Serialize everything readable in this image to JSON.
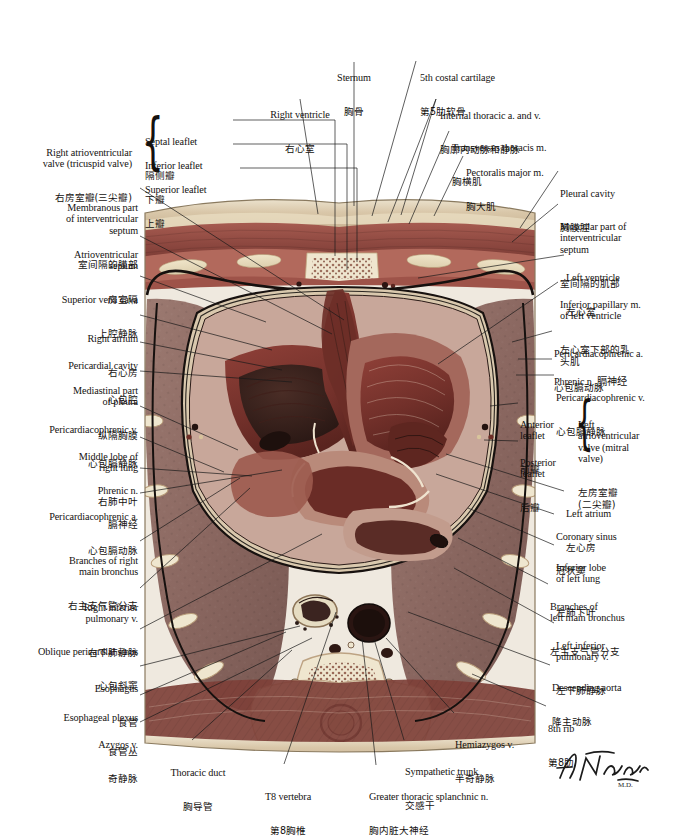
{
  "plate": {
    "title": "Cross Section of Thorax at T8 Vertebral Level",
    "artist_signature": "F. Netter",
    "figure_caption": ""
  },
  "colors": {
    "ink": "#14110f",
    "leader": "#1a1a1a",
    "muscle": "#9c4d46",
    "lung": "#8e6f68",
    "fat": "#e3d8bd",
    "bone": "#efe6cf",
    "cavity": "#3b2520",
    "myocardium": "#7e3a33",
    "vessel_dark": "#2b1714",
    "pleura": "#141110",
    "skin": "#d9c9ad"
  },
  "labels_top": [
    {
      "id": "sternum",
      "en": "Sternum",
      "cn": "胸骨",
      "align": "c",
      "x": 311,
      "y": 49,
      "w": 86
    },
    {
      "id": "right-ventricle",
      "en": "Right ventricle",
      "cn": "右心室",
      "align": "c",
      "x": 252,
      "y": 86,
      "w": 96
    },
    {
      "id": "5th-costal-cartilage",
      "en": "5th costal cartilage",
      "cn": "第5肋软骨",
      "align": "l",
      "x": 420,
      "y": 49,
      "w": 120
    },
    {
      "id": "internal-thoracic",
      "en": "Internal thoracic a. and v.",
      "cn": "胸廓内动脉和静脉",
      "align": "l",
      "x": 440,
      "y": 87,
      "w": 140
    },
    {
      "id": "transversus-thoracis",
      "en": "Transversus thoracis m.",
      "cn": "胸横肌",
      "align": "l",
      "x": 452,
      "y": 119,
      "w": 128
    },
    {
      "id": "pectoralis-major",
      "en": "Pectoralis major m.",
      "cn": "胸大肌",
      "align": "l",
      "x": 466,
      "y": 144,
      "w": 120
    }
  ],
  "labels_left": [
    {
      "id": "septal-leaflet",
      "en": "Septal leaflet",
      "cn": "隔侧瓣",
      "align": "l",
      "x": 145,
      "y": 116,
      "w": 80
    },
    {
      "id": "inferior-leaflet",
      "en": "Inferior leaflet",
      "cn": "下瓣",
      "align": "l",
      "x": 145,
      "y": 140,
      "w": 80
    },
    {
      "id": "superior-leaflet",
      "en": "Superior leaflet",
      "cn": "上瓣",
      "align": "l",
      "x": 145,
      "y": 164,
      "w": 86
    },
    {
      "id": "right-av-valve",
      "en": "Right atrioventricular\nvalve (tricuspid valve)",
      "cn": "右房室瓣(三尖瓣)",
      "align": "r",
      "x": 16,
      "y": 125,
      "w": 122
    },
    {
      "id": "membranous-ivs",
      "en": "Membranous part\nof interventricular\nseptum",
      "cn": "室间隔的膜部",
      "align": "r",
      "x": 22,
      "y": 180,
      "w": 116
    },
    {
      "id": "av-septum",
      "en": "Atrioventricular\nseptum",
      "cn": "房室隔",
      "align": "r",
      "x": 22,
      "y": 230,
      "w": 116
    },
    {
      "id": "superior-vena-cava",
      "en": "Superior vena cava",
      "cn": "上腔静脉",
      "align": "r",
      "x": 16,
      "y": 273,
      "w": 122
    },
    {
      "id": "right-atrium",
      "en": "Right atrium",
      "cn": "右心房",
      "align": "r",
      "x": 30,
      "y": 311,
      "w": 108
    },
    {
      "id": "pericardial-cavity",
      "en": "Pericardial cavity",
      "cn": "心包腔",
      "align": "r",
      "x": 22,
      "y": 338,
      "w": 116
    },
    {
      "id": "mediastinal-pleura",
      "en": "Mediastinal part\nof pleura",
      "cn": "纵隔胸膜",
      "align": "r",
      "x": 22,
      "y": 364,
      "w": 116
    },
    {
      "id": "pericardiacophrenic-v-left",
      "en": "Pericardiacophrenic v.",
      "cn": "心包膈静脉",
      "align": "r",
      "x": 8,
      "y": 402,
      "w": 130
    },
    {
      "id": "middle-lobe-right-lung",
      "en": "Middle lobe of\nright lung",
      "cn": "右肺中叶",
      "align": "r",
      "x": 30,
      "y": 430,
      "w": 108
    },
    {
      "id": "phrenic-n-left",
      "en": "Phrenic n.",
      "cn": "膈神经",
      "align": "r",
      "x": 40,
      "y": 464,
      "w": 98
    },
    {
      "id": "pericardiacophrenic-a-left",
      "en": "Pericardiacophrenic a.",
      "cn": "心包膈动脉",
      "align": "r",
      "x": 8,
      "y": 489,
      "w": 130
    },
    {
      "id": "branches-right-bronchus",
      "en": "Branches of right\nmain bronchus",
      "cn": "右主支气管分支",
      "align": "r",
      "x": 26,
      "y": 534,
      "w": 112
    },
    {
      "id": "right-inferior-pulmonary-v",
      "en": "Right inferior\npulmonary v.",
      "cn": "右下肺静脉",
      "align": "r",
      "x": 34,
      "y": 581,
      "w": 104
    },
    {
      "id": "oblique-pericardial-sinus",
      "en": "Oblique pericardial sinus",
      "cn": "心包斜窦",
      "align": "r",
      "x": 8,
      "y": 625,
      "w": 130
    },
    {
      "id": "esophagus",
      "en": "Esophagus",
      "cn": "食管",
      "align": "r",
      "x": 40,
      "y": 662,
      "w": 98
    },
    {
      "id": "esophageal-plexus",
      "en": "Esophageal plexus",
      "cn": "食管丛",
      "align": "r",
      "x": 22,
      "y": 691,
      "w": 116
    },
    {
      "id": "azygos-v",
      "en": "Azygos v.",
      "cn": "奇静脉",
      "align": "r",
      "x": 54,
      "y": 718,
      "w": 84
    }
  ],
  "labels_bottom": [
    {
      "id": "thoracic-duct",
      "en": "Thoracic duct",
      "cn": "胸导管",
      "align": "c",
      "x": 148,
      "y": 746,
      "w": 96
    },
    {
      "id": "t8-vertebra",
      "en": "T8 vertebra",
      "cn": "第8胸椎",
      "align": "c",
      "x": 238,
      "y": 770,
      "w": 96
    },
    {
      "id": "greater-splanchnic-n",
      "en": "Greater thoracic splanchnic n.",
      "cn": "胸内脏大神经",
      "align": "l",
      "x": 369,
      "y": 770,
      "w": 160
    },
    {
      "id": "sympathetic-trunk",
      "en": "Sympathetic trunk",
      "cn": "交感干",
      "align": "l",
      "x": 405,
      "y": 745,
      "w": 120
    },
    {
      "id": "hemiazygos-v",
      "en": "Hemiazygos v.",
      "cn": "半奇静脉",
      "align": "l",
      "x": 455,
      "y": 718,
      "w": 110
    }
  ],
  "labels_right": [
    {
      "id": "pleural-cavity",
      "en": "Pleural cavity",
      "cn": "胸膜腔",
      "align": "l",
      "x": 560,
      "y": 167,
      "w": 110
    },
    {
      "id": "muscular-ivs",
      "en": "Muscular part of\ninterventricular\nseptum",
      "cn": "室间隔的肌部",
      "align": "l",
      "x": 560,
      "y": 200,
      "w": 112
    },
    {
      "id": "left-ventricle",
      "en": "Left ventricle",
      "cn": "左心室",
      "align": "l",
      "x": 566,
      "y": 251,
      "w": 106
    },
    {
      "id": "inferior-papillary-m",
      "en": "Inferior papillary m.\nof left ventricle",
      "cn": "左心室下部的乳\n头肌",
      "align": "l",
      "x": 560,
      "y": 278,
      "w": 114
    },
    {
      "id": "pericardiacophrenic-a-right",
      "en": "Pericardiacophrenic a.",
      "cn": "心包膈动脉",
      "align": "l",
      "x": 554,
      "y": 327,
      "w": 120
    },
    {
      "id": "phrenic-n-right",
      "en": "Phrenic n. 膈神经",
      "cn": "",
      "align": "l",
      "x": 554,
      "y": 355,
      "w": 120
    },
    {
      "id": "pericardiacophrenic-v-right",
      "en": "Pericardiacophrenic v.",
      "cn": "心包膈静脉",
      "align": "l",
      "x": 556,
      "y": 371,
      "w": 118
    },
    {
      "id": "anterior-leaflet",
      "en": "Anterior\nleaflet",
      "cn": "前瓣",
      "align": "l",
      "x": 520,
      "y": 399,
      "w": 44
    },
    {
      "id": "posterior-leaflet",
      "en": "Posterior\nleaflet",
      "cn": "后瓣",
      "align": "l",
      "x": 520,
      "y": 437,
      "w": 46
    },
    {
      "id": "left-av-valve",
      "en": "Left\natrioventricular\nvalve (mitral\nvalve)",
      "cn": "左房室瓣\n(二尖瓣)",
      "align": "l",
      "x": 578,
      "y": 399,
      "w": 96
    },
    {
      "id": "left-atrium",
      "en": "Left atrium",
      "cn": "左心房",
      "align": "l",
      "x": 566,
      "y": 487,
      "w": 106
    },
    {
      "id": "coronary-sinus",
      "en": "Coronary sinus",
      "cn": "冠状窦",
      "align": "l",
      "x": 556,
      "y": 510,
      "w": 116
    },
    {
      "id": "inferior-lobe-left-lung",
      "en": "Inferior lobe\nof left lung",
      "cn": "左肺下叶",
      "align": "l",
      "x": 556,
      "y": 541,
      "w": 116
    },
    {
      "id": "branches-left-bronchus",
      "en": "Branches of\nleft main bronchus",
      "cn": "左主支气管分支",
      "align": "l",
      "x": 550,
      "y": 580,
      "w": 124
    },
    {
      "id": "left-inferior-pulmonary-v",
      "en": "Left inferior\npulmonary v.",
      "cn": "左下肺静脉",
      "align": "l",
      "x": 556,
      "y": 619,
      "w": 118
    },
    {
      "id": "descending-aorta",
      "en": "Descending aorta",
      "cn": "降主动脉",
      "align": "l",
      "x": 552,
      "y": 661,
      "w": 122
    },
    {
      "id": "8th-rib",
      "en": "8th rib",
      "cn": "第8肋",
      "align": "l",
      "x": 548,
      "y": 702,
      "w": 80
    }
  ],
  "leaders": [
    {
      "id": "ld-sternum",
      "d": "M 354 62 L 354 206"
    },
    {
      "id": "ld-right-ventricle",
      "d": "M 300 99 L 316 213"
    },
    {
      "id": "ld-5th-costal",
      "d": "M 418 61 L 370 215"
    },
    {
      "id": "ld-internal-thoracic-1",
      "d": "M 438 99 L 386 221"
    },
    {
      "id": "ld-internal-thoracic-2",
      "d": "M 438 99 L 399 214"
    },
    {
      "id": "ld-transversus",
      "d": "M 450 131 L 408 223"
    },
    {
      "id": "ld-pectoralis",
      "d": "M 464 156 L 432 215"
    },
    {
      "id": "ld-septal-leaflet",
      "d": "M 232 119 L 337 119 L 337 252"
    },
    {
      "id": "ld-inferior-leaflet",
      "d": "M 232 143 L 348 143 L 348 266"
    },
    {
      "id": "ld-superior-leaflet",
      "d": "M 238 167 L 356 167 L 356 258"
    },
    {
      "id": "ld-membranous-ivs",
      "d": "M 141 186 L 342 318"
    },
    {
      "id": "ld-av-septum",
      "d": "M 141 234 L 330 332"
    },
    {
      "id": "ld-svc",
      "d": "M 141 275 L 268 320"
    },
    {
      "id": "ld-right-atrium",
      "d": "M 141 314 L 272 348"
    },
    {
      "id": "ld-pericardial-cavity",
      "d": "M 141 341 L 282 368"
    },
    {
      "id": "ld-mediastinal-pleura",
      "d": "M 141 370 L 292 381"
    },
    {
      "id": "ld-pcp-v-left",
      "d": "M 141 405 L 240 449"
    },
    {
      "id": "ld-middle-lobe-right",
      "d": "M 141 436 L 226 471"
    },
    {
      "id": "ld-phrenic-left",
      "d": "M 141 467 L 253 474"
    },
    {
      "id": "ld-pcp-a-left",
      "d": "M 141 492 L 282 468"
    },
    {
      "id": "ld-branches-right-bronchus",
      "d": "M 141 540 L 240 477"
    },
    {
      "id": "ld-right-inf-pulm-v",
      "d": "M 141 587 L 250 486"
    },
    {
      "id": "ld-oblique-sinus",
      "d": "M 141 628 L 322 533"
    },
    {
      "id": "ld-esophagus",
      "d": "M 141 665 L 300 624"
    },
    {
      "id": "ld-esoph-plexus",
      "d": "M 141 694 L 286 631"
    },
    {
      "id": "ld-azygos",
      "d": "M 141 721 L 312 636"
    },
    {
      "id": "ld-thoracic-duct",
      "d": "M 190 740 L 290 648"
    },
    {
      "id": "ld-t8-vertebra",
      "d": "M 282 764 L 334 610"
    },
    {
      "id": "ld-splanchnic",
      "d": "M 374 765 L 360 636"
    },
    {
      "id": "ld-sympathetic",
      "d": "M 403 740 L 372 637"
    },
    {
      "id": "ld-hemiazygos",
      "d": "M 453 713 L 385 636"
    },
    {
      "id": "ld-pleural-cavity",
      "d": "M 558 170 L 520 226"
    },
    {
      "id": "ld-muscular-ivs",
      "d": "M 558 203 L 512 240"
    },
    {
      "id": "ld-left-ventricle",
      "d": "M 564 254 L 420 276"
    },
    {
      "id": "ld-inf-papillary",
      "d": "M 558 281 L 440 362"
    },
    {
      "id": "ld-pcp-a-right",
      "d": "M 552 330 L 514 340"
    },
    {
      "id": "ld-phrenic-right",
      "d": "M 552 358 L 520 358"
    },
    {
      "id": "ld-pcp-v-right",
      "d": "M 554 374 L 518 374"
    },
    {
      "id": "ld-ant-leaflet",
      "d": "M 518 402 L 492 404"
    },
    {
      "id": "ld-post-leaflet",
      "d": "M 518 440 L 486 438"
    },
    {
      "id": "ld-left-atrium",
      "d": "M 564 490 L 448 452"
    },
    {
      "id": "ld-coronary-sinus",
      "d": "M 554 513 L 438 472"
    },
    {
      "id": "ld-inf-lobe-left-lung",
      "d": "M 554 544 L 470 506"
    },
    {
      "id": "ld-branches-left-bronchus",
      "d": "M 548 583 L 460 536"
    },
    {
      "id": "ld-left-inf-pulm-v",
      "d": "M 554 622 L 456 566"
    },
    {
      "id": "ld-descending-aorta",
      "d": "M 550 664 L 410 610"
    },
    {
      "id": "ld-8th-rib",
      "d": "M 546 705 L 474 672"
    }
  ]
}
